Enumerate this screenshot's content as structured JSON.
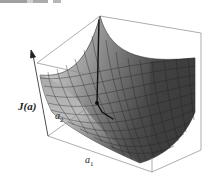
{
  "figure": {
    "type": "3d-surface-plot",
    "z_axis_label": "J(a)",
    "z_axis_label_main": "J",
    "z_axis_label_arg": "(a)",
    "x_axis_label_base": "a",
    "x_axis_label_sub": "1",
    "y_axis_label_base": "a",
    "y_axis_label_sub": "2",
    "colors": {
      "surface_light": "#e6e6e6",
      "surface_dark": "#3a3a3a",
      "grid_lines": "#222222",
      "box_lines": "#8a8a8a",
      "trajectory": "#111111"
    },
    "grid_divisions": 14
  }
}
